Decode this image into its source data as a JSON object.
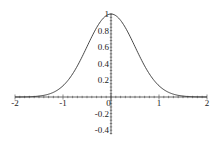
{
  "chart_data": {
    "type": "line",
    "title": "",
    "xlabel": "",
    "ylabel": "",
    "function": "exp(-2*x^2)",
    "xlim": [
      -2,
      2
    ],
    "ylim": [
      -0.45,
      1
    ],
    "grid": false,
    "legend": null,
    "x_ticks": [
      "-2",
      "-1",
      "0",
      "1",
      "2"
    ],
    "y_ticks": [
      "1",
      "0.8",
      "0.6",
      "0.4",
      "0.2",
      "-0.2",
      "-0.4"
    ],
    "series": [
      {
        "name": "curve",
        "x": [
          -2,
          -1.75,
          -1.5,
          -1.25,
          -1,
          -0.75,
          -0.5,
          -0.25,
          0,
          0.25,
          0.5,
          0.75,
          1,
          1.25,
          1.5,
          1.75,
          2
        ],
        "values": [
          0.0003,
          0.0022,
          0.011,
          0.044,
          0.135,
          0.325,
          0.607,
          0.882,
          1.0,
          0.882,
          0.607,
          0.325,
          0.135,
          0.044,
          0.011,
          0.0022,
          0.0003
        ]
      }
    ],
    "colors": {
      "line": "#333333",
      "axis": "#444444"
    }
  }
}
